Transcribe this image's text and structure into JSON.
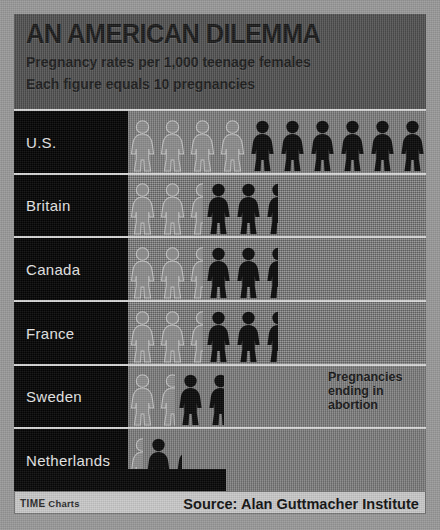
{
  "header": {
    "title": "AN AMERICAN DILEMMA",
    "subtitle1": "Pregnancy rates per 1,000 teenage females",
    "subtitle2": "Each figure equals 10 pregnancies"
  },
  "annotation": {
    "line1": "Pregnancies",
    "line2": "ending in",
    "line3": "abortion"
  },
  "footer": {
    "brand": "TIME",
    "brand_suffix": " Charts",
    "source": "Source: Alan Guttmacher Institute"
  },
  "colors": {
    "background": "#9a9a9a",
    "header_bg": "#4e4e4e",
    "label_bg": "#050505",
    "plot_bg": "#7d7d7d",
    "figure_solid": "#0a0a0a",
    "figure_ghost": "#8d8d8d",
    "rule": "#d8d8d8",
    "footer_bg": "#c9c9c9",
    "label_text": "#e8e8e8",
    "title_text": "#1a1a1a"
  },
  "chart_data": {
    "type": "bar",
    "title": "AN AMERICAN DILEMMA",
    "subtitle": "Pregnancy rates per 1,000 teenage females",
    "note": "Each figure equals 10 pregnancies",
    "unit_per_figure": 10,
    "ylabel": "",
    "xlabel": "Pregnancies per 1,000 teenage females",
    "grid": false,
    "legend": "Ghosted figures at left of each bar represent pregnancies ending in abortion; solid figures represent total pregnancies.",
    "categories": [
      "U.S.",
      "Britain",
      "Canada",
      "France",
      "Sweden",
      "Netherlands"
    ],
    "series": [
      {
        "name": "Total pregnancies (figures shown)",
        "values": [
          10,
          4.5,
          4.5,
          4.5,
          2,
          1.2
        ],
        "rates": [
          100,
          45,
          45,
          45,
          20,
          12
        ]
      },
      {
        "name": "Pregnancies ending in abortion (ghost figures)",
        "values": [
          4,
          2,
          2,
          2,
          1.5,
          0.5
        ],
        "rates": [
          40,
          20,
          20,
          20,
          15,
          5
        ]
      }
    ],
    "source": "Source: Alan Guttmacher Institute"
  },
  "rows": [
    {
      "label": "U.S.",
      "ghost": 4,
      "solid": 6,
      "ghost_partial": 0,
      "solid_partial": 0.6
    },
    {
      "label": "Britain",
      "ghost": 2,
      "solid": 2,
      "ghost_partial": 0.5,
      "solid_partial": 0.5
    },
    {
      "label": "Canada",
      "ghost": 2,
      "solid": 2,
      "ghost_partial": 0.5,
      "solid_partial": 0.5
    },
    {
      "label": "France",
      "ghost": 2,
      "solid": 2,
      "ghost_partial": 0.5,
      "solid_partial": 0.5
    },
    {
      "label": "Sweden",
      "ghost": 1,
      "solid": 1,
      "ghost_partial": 0.6,
      "solid_partial": 0.6
    },
    {
      "label": "Netherlands",
      "ghost": 0,
      "solid": 1,
      "ghost_partial": 0.5,
      "solid_partial": 0.3
    }
  ]
}
